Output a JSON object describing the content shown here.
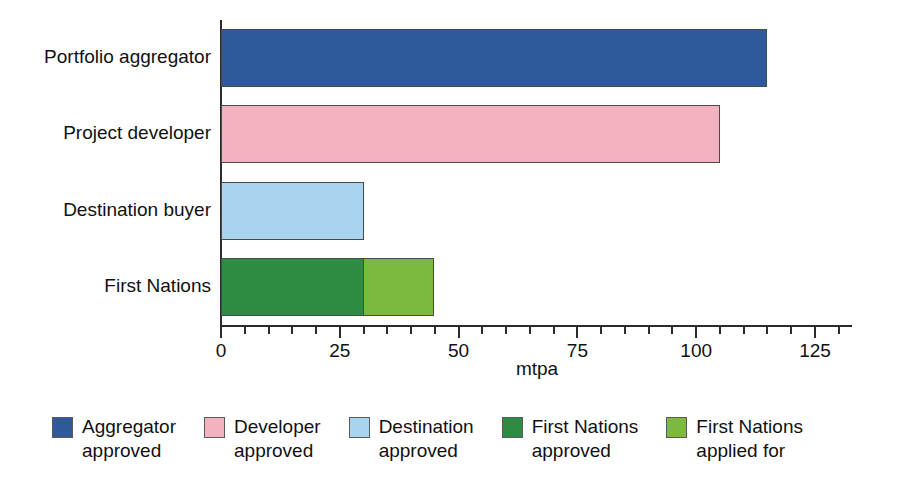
{
  "chart_data": {
    "type": "bar",
    "orientation": "horizontal",
    "stacked": true,
    "title": "",
    "subtitle": "",
    "xlabel": "mtpa",
    "ylabel": "",
    "xlim": [
      0,
      133
    ],
    "xticks": [
      0,
      25,
      50,
      75,
      100,
      125
    ],
    "xtick_labels": [
      "0",
      "25",
      "50",
      "75",
      "100",
      "125"
    ],
    "minor_tick_interval": 5,
    "grid": false,
    "categories": [
      "Portfolio aggregator",
      "Project developer",
      "Destination buyer",
      "First Nations"
    ],
    "series": [
      {
        "name": "Aggregator approved",
        "color": "#2E5A9C",
        "values": [
          115,
          0,
          0,
          0
        ]
      },
      {
        "name": "Developer approved",
        "color": "#F3B2C0",
        "values": [
          0,
          105,
          0,
          0
        ]
      },
      {
        "name": "Destination approved",
        "color": "#A8D4F0",
        "values": [
          0,
          0,
          30,
          0
        ]
      },
      {
        "name": "First Nations approved",
        "color": "#2E8B44",
        "values": [
          0,
          0,
          0,
          30
        ]
      },
      {
        "name": "First Nations applied for",
        "color": "#7DB83F",
        "values": [
          0,
          0,
          0,
          15
        ]
      }
    ],
    "bars": [
      {
        "category": "Portfolio aggregator",
        "total": 115,
        "segments": [
          {
            "label": "Aggregator approved",
            "value": 115,
            "color": "#2E5A9C"
          }
        ]
      },
      {
        "category": "Project developer",
        "total": 105,
        "segments": [
          {
            "label": "Developer approved",
            "value": 105,
            "color": "#F3B2C0"
          }
        ]
      },
      {
        "category": "Destination buyer",
        "total": 30,
        "segments": [
          {
            "label": "Destination approved",
            "value": 30,
            "color": "#A8D4F0"
          }
        ]
      },
      {
        "category": "First Nations",
        "total": 45,
        "segments": [
          {
            "label": "First Nations approved",
            "value": 30,
            "color": "#2E8B44"
          },
          {
            "label": "First Nations applied for",
            "value": 15,
            "color": "#7DB83F"
          }
        ]
      }
    ],
    "legend": {
      "position": "bottom",
      "entries": [
        {
          "label_line1": "Aggregator",
          "label_line2": "approved",
          "color": "#2E5A9C"
        },
        {
          "label_line1": "Developer",
          "label_line2": "approved",
          "color": "#F3B2C0"
        },
        {
          "label_line1": "Destination",
          "label_line2": "approved",
          "color": "#A8D4F0"
        },
        {
          "label_line1": "First Nations",
          "label_line2": "approved",
          "color": "#2E8B44"
        },
        {
          "label_line1": "First Nations",
          "label_line2": "applied for",
          "color": "#7DB83F"
        }
      ]
    }
  }
}
